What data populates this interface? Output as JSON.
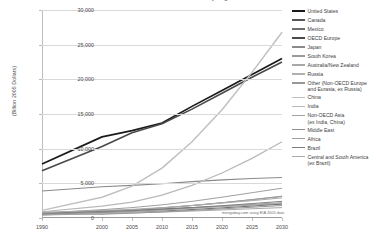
{
  "chart_data": {
    "type": "line",
    "title": "Gross Domestic Product by Region",
    "xlabel": "",
    "ylabel": "(Billion 2005 Dollars)",
    "x": [
      1990,
      2000,
      2005,
      2010,
      2015,
      2020,
      2025,
      2030
    ],
    "xtick_labels": [
      "1990",
      "2000",
      "2005",
      "2010",
      "2015",
      "2020",
      "2025",
      "2030"
    ],
    "ytick_labels": [
      "0",
      "5,000",
      "10,000",
      "15,000",
      "20,000",
      "25,000",
      "30,000"
    ],
    "ytick_values": [
      0,
      5000,
      10000,
      15000,
      20000,
      25000,
      30000
    ],
    "ylim": [
      0,
      30000
    ],
    "xlim": [
      1990,
      2030
    ],
    "grid": true,
    "legend_position": "right",
    "annotation": "mongabay.com using EIA 2005 data",
    "series": [
      {
        "name": "United States",
        "color": "#1a1a1a",
        "width": 1.7,
        "values": [
          7800,
          11700,
          12600,
          13700,
          16100,
          18400,
          20700,
          23000
        ]
      },
      {
        "name": "Canada",
        "color": "#555555",
        "width": 1.0,
        "values": [
          700,
          1000,
          1130,
          1290,
          1500,
          1700,
          1900,
          2100
        ]
      },
      {
        "name": "Mexico",
        "color": "#6e6e6e",
        "width": 1.0,
        "values": [
          560,
          800,
          880,
          1010,
          1220,
          1460,
          1720,
          2000
        ]
      },
      {
        "name": "OECD Europe",
        "color": "#4a4a4a",
        "width": 1.6,
        "values": [
          6800,
          10300,
          12300,
          13600,
          15700,
          18000,
          20300,
          22500
        ]
      },
      {
        "name": "Japan",
        "color": "#8a8a8a",
        "width": 1.1,
        "values": [
          3900,
          4500,
          4700,
          4950,
          5250,
          5500,
          5700,
          5850
        ]
      },
      {
        "name": "South Korea",
        "color": "#9a9a9a",
        "width": 1.0,
        "values": [
          430,
          780,
          940,
          1150,
          1420,
          1680,
          1930,
          2180
        ]
      },
      {
        "name": "Australia/New Zealand",
        "color": "#a8a8a8",
        "width": 1.0,
        "values": [
          420,
          620,
          730,
          850,
          1000,
          1160,
          1330,
          1500
        ]
      },
      {
        "name": "Russia",
        "color": "#b0b0b0",
        "width": 1.0,
        "values": [
          900,
          620,
          870,
          1100,
          1380,
          1650,
          1900,
          2150
        ]
      },
      {
        "name": "Other (Non-OECD Europe\nand Eurasia, ex Russia)",
        "color": "#989898",
        "width": 1.0,
        "values": [
          620,
          540,
          700,
          880,
          1100,
          1320,
          1550,
          1800
        ]
      },
      {
        "name": "China",
        "color": "#c0c0c0",
        "width": 1.5,
        "values": [
          1100,
          3000,
          4600,
          7200,
          11000,
          15600,
          21000,
          26800
        ]
      },
      {
        "name": "India",
        "color": "#b8b8b8",
        "width": 1.2,
        "values": [
          900,
          1700,
          2300,
          3300,
          4700,
          6500,
          8600,
          11000
        ]
      },
      {
        "name": "Non-OECD Asia\n(ex India, China)",
        "color": "#a0a0a0",
        "width": 1.0,
        "values": [
          700,
          1200,
          1500,
          1900,
          2400,
          3000,
          3650,
          4300
        ]
      },
      {
        "name": "Middle East",
        "color": "#8e8e8e",
        "width": 1.0,
        "values": [
          600,
          900,
          1150,
          1450,
          1800,
          2200,
          2650,
          3100
        ]
      },
      {
        "name": "Africa",
        "color": "#9e9e9e",
        "width": 1.0,
        "values": [
          700,
          950,
          1150,
          1450,
          1800,
          2200,
          2650,
          3150
        ]
      },
      {
        "name": "Brazil",
        "color": "#7e7e7e",
        "width": 1.0,
        "values": [
          700,
          950,
          1050,
          1250,
          1500,
          1780,
          2080,
          2400
        ]
      },
      {
        "name": "Central and South America\n(ex Brazil)",
        "color": "#aaaaaa",
        "width": 1.0,
        "values": [
          800,
          1100,
          1250,
          1500,
          1800,
          2150,
          2500,
          2900
        ]
      }
    ]
  }
}
